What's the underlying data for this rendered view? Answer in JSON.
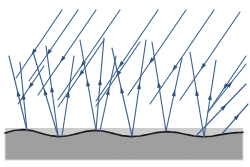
{
  "figure": {
    "width": 250,
    "height": 167,
    "background_color": "#ffffff"
  },
  "colors": {
    "ray": "#3d6593",
    "ray_dark": "#2f537c",
    "arrowhead": "#2f537c",
    "surface_fill": "#a3a3a3",
    "surface_fill_shade": "#999999",
    "surface_edge": "#1a1a1a",
    "surface_border": "#d8d8d8",
    "background": "#ffffff"
  },
  "surface": {
    "label": "rough-surface-block",
    "left": 5,
    "right": 243,
    "bottom": 160,
    "edge_stroke_width": 1.6,
    "profile_points": [
      [
        5,
        133
      ],
      [
        14,
        130.5
      ],
      [
        23,
        129.6
      ],
      [
        32,
        130.6
      ],
      [
        41,
        133.2
      ],
      [
        50,
        135.6
      ],
      [
        59,
        136.6
      ],
      [
        68,
        135.8
      ],
      [
        77,
        133.6
      ],
      [
        86,
        131.4
      ],
      [
        95,
        130.4
      ],
      [
        104,
        131.2
      ],
      [
        113,
        133.4
      ],
      [
        122,
        135.6
      ],
      [
        131,
        136.6
      ],
      [
        140,
        136.0
      ],
      [
        149,
        134.2
      ],
      [
        158,
        132.4
      ],
      [
        167,
        131.6
      ],
      [
        176,
        132.4
      ],
      [
        185,
        134.2
      ],
      [
        194,
        136.0
      ],
      [
        203,
        136.8
      ],
      [
        212,
        136.2
      ],
      [
        221,
        134.6
      ],
      [
        230,
        133.2
      ],
      [
        237,
        132.6
      ],
      [
        243,
        132.4
      ]
    ]
  },
  "rays": {
    "stroke_width": 1.15,
    "arrow_size": 3.6,
    "incident_label": "incident-ray",
    "reflected_label": "reflected-ray",
    "incident": [
      {
        "x1": 62,
        "y1": 10,
        "x2": 16,
        "y2": 78,
        "arrow_t": 0.62
      },
      {
        "x1": 78,
        "y1": 10,
        "x2": 29,
        "y2": 81,
        "arrow_t": 0.6
      },
      {
        "x1": 96,
        "y1": 10,
        "x2": 38,
        "y2": 95,
        "arrow_t": 0.58
      },
      {
        "x1": 44,
        "y1": 66,
        "x2": 18,
        "y2": 104,
        "arrow_t": 0.52
      },
      {
        "x1": 120,
        "y1": 10,
        "x2": 58,
        "y2": 100,
        "arrow_t": 0.6
      },
      {
        "x1": 104,
        "y1": 40,
        "x2": 58,
        "y2": 107,
        "arrow_t": 0.5
      },
      {
        "x1": 158,
        "y1": 10,
        "x2": 96,
        "y2": 101,
        "arrow_t": 0.6
      },
      {
        "x1": 140,
        "y1": 42,
        "x2": 96,
        "y2": 106,
        "arrow_t": 0.5
      },
      {
        "x1": 186,
        "y1": 10,
        "x2": 128,
        "y2": 95,
        "arrow_t": 0.6
      },
      {
        "x1": 214,
        "y1": 10,
        "x2": 150,
        "y2": 104,
        "arrow_t": 0.62
      },
      {
        "x1": 240,
        "y1": 12,
        "x2": 180,
        "y2": 100,
        "arrow_t": 0.62
      },
      {
        "x1": 246,
        "y1": 56,
        "x2": 208,
        "y2": 112,
        "arrow_t": 0.55
      }
    ],
    "reflected": [
      {
        "x1": 27,
        "y1": 131,
        "x2": 9,
        "y2": 56,
        "arrow_t": 0.5,
        "dir": "up"
      },
      {
        "x1": 27,
        "y1": 131,
        "x2": 20,
        "y2": 62,
        "arrow_t": 0.5,
        "dir": "up"
      },
      {
        "x1": 58,
        "y1": 136,
        "x2": 33,
        "y2": 52,
        "arrow_t": 0.52,
        "dir": "up"
      },
      {
        "x1": 58,
        "y1": 136,
        "x2": 46,
        "y2": 46,
        "arrow_t": 0.52,
        "dir": "up"
      },
      {
        "x1": 62,
        "y1": 136,
        "x2": 74,
        "y2": 56,
        "arrow_t": 0.52,
        "dir": "up"
      },
      {
        "x1": 96,
        "y1": 130,
        "x2": 80,
        "y2": 40,
        "arrow_t": 0.52,
        "dir": "up"
      },
      {
        "x1": 96,
        "y1": 130,
        "x2": 104,
        "y2": 38,
        "arrow_t": 0.52,
        "dir": "up"
      },
      {
        "x1": 100,
        "y1": 131,
        "x2": 116,
        "y2": 56,
        "arrow_t": 0.52,
        "dir": "up"
      },
      {
        "x1": 132,
        "y1": 136,
        "x2": 112,
        "y2": 48,
        "arrow_t": 0.52,
        "dir": "up"
      },
      {
        "x1": 132,
        "y1": 136,
        "x2": 146,
        "y2": 40,
        "arrow_t": 0.52,
        "dir": "up"
      },
      {
        "x1": 166,
        "y1": 131,
        "x2": 152,
        "y2": 42,
        "arrow_t": 0.52,
        "dir": "up"
      },
      {
        "x1": 166,
        "y1": 131,
        "x2": 182,
        "y2": 58,
        "arrow_t": 0.52,
        "dir": "up"
      },
      {
        "x1": 204,
        "y1": 137,
        "x2": 190,
        "y2": 52,
        "arrow_t": 0.52,
        "dir": "up"
      },
      {
        "x1": 204,
        "y1": 137,
        "x2": 216,
        "y2": 60,
        "arrow_t": 0.52,
        "dir": "up"
      },
      {
        "x1": 196,
        "y1": 136,
        "x2": 246,
        "y2": 84,
        "arrow_t": 0.56,
        "dir": "up-right"
      },
      {
        "x1": 222,
        "y1": 134,
        "x2": 248,
        "y2": 104,
        "arrow_t": 0.58,
        "dir": "up-right"
      },
      {
        "x1": 208,
        "y1": 112,
        "x2": 246,
        "y2": 64,
        "arrow_t": 0.58,
        "dir": "up-right"
      }
    ]
  }
}
